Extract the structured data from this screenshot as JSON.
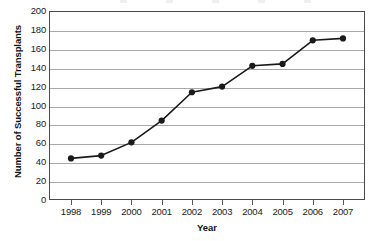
{
  "chart_data": {
    "type": "line",
    "title": "",
    "xlabel": "Year",
    "ylabel": "Number of Successful Transplants",
    "categories": [
      "1998",
      "1999",
      "2000",
      "2001",
      "2002",
      "2003",
      "2004",
      "2005",
      "2006",
      "2007"
    ],
    "values": [
      44,
      47,
      61,
      84,
      114,
      120,
      142,
      144,
      169,
      171
    ],
    "series": [
      {
        "name": "Successful Transplants",
        "values": [
          44,
          47,
          61,
          84,
          114,
          120,
          142,
          144,
          169,
          171
        ]
      }
    ],
    "ylim": [
      0,
      200
    ],
    "ytick_labels": [
      "200",
      "180",
      "160",
      "140",
      "120",
      "100",
      "80",
      "60",
      "40",
      "20",
      "0"
    ],
    "ytick_values": [
      200,
      180,
      160,
      140,
      120,
      100,
      80,
      60,
      40,
      20,
      0
    ],
    "ytick_step": 20,
    "xtick_labels": [
      "1998",
      "1999",
      "2000",
      "2001",
      "2002",
      "2003",
      "2004",
      "2005",
      "2006",
      "2007"
    ],
    "grid": "horizontal",
    "legend": "none",
    "marker": "filled-circle",
    "line_color": "#1a1a1a",
    "marker_color": "#1a1a1a",
    "grid_color": "#a8a8a8",
    "axis_color": "#4a4a4a",
    "background_color": "#ffffff"
  }
}
